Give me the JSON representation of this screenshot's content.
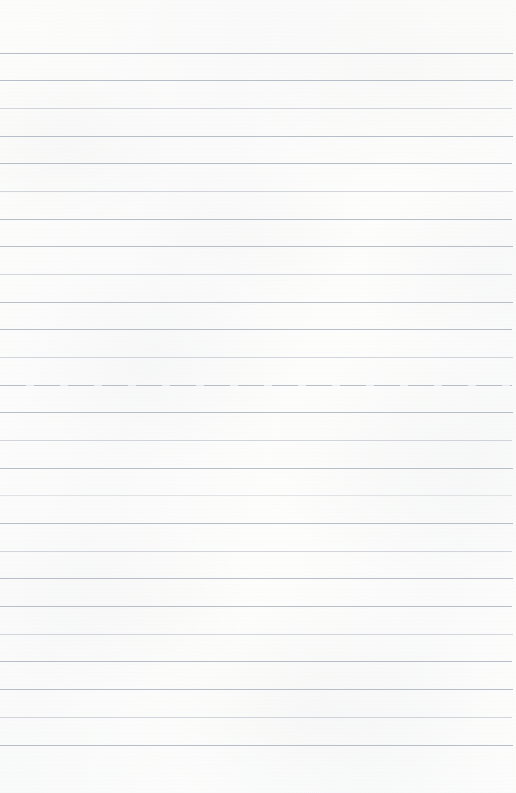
{
  "document": {
    "kind": "ruled-notebook-page",
    "title": "Blank ruled notebook page",
    "page_width": 516,
    "page_height": 793,
    "has_handwriting": false,
    "has_header": false,
    "has_margin_rule": false,
    "has_page_number": false,
    "written_text": ""
  },
  "paper": {
    "background_color": "#fdfdfc",
    "texture_color": "#969aa0",
    "edge_color": "#ffffff"
  },
  "ruling": {
    "line_color": "#b8bec8",
    "line_thickness": 1,
    "line_spacing": 27.7,
    "first_line_y": 53,
    "last_line_y": 745,
    "line_start_x": 0,
    "line_end_x": 512,
    "line_count": 26,
    "lines": [
      {
        "y": 53,
        "x": 0,
        "width": 513,
        "style": "normal"
      },
      {
        "y": 80,
        "x": 0,
        "width": 513,
        "style": "normal"
      },
      {
        "y": 108,
        "x": 0,
        "width": 512,
        "style": "faint"
      },
      {
        "y": 136,
        "x": 0,
        "width": 513,
        "style": "normal"
      },
      {
        "y": 163,
        "x": 0,
        "width": 512,
        "style": "normal"
      },
      {
        "y": 191,
        "x": 0,
        "width": 513,
        "style": "faint"
      },
      {
        "y": 219,
        "x": 0,
        "width": 512,
        "style": "normal"
      },
      {
        "y": 246,
        "x": 0,
        "width": 513,
        "style": "normal"
      },
      {
        "y": 274,
        "x": 0,
        "width": 512,
        "style": "faint"
      },
      {
        "y": 302,
        "x": 0,
        "width": 513,
        "style": "normal"
      },
      {
        "y": 329,
        "x": 0,
        "width": 512,
        "style": "normal"
      },
      {
        "y": 357,
        "x": 0,
        "width": 513,
        "style": "faint"
      },
      {
        "y": 385,
        "x": 0,
        "width": 512,
        "style": "broken"
      },
      {
        "y": 412,
        "x": 0,
        "width": 513,
        "style": "normal"
      },
      {
        "y": 440,
        "x": 0,
        "width": 512,
        "style": "faint"
      },
      {
        "y": 468,
        "x": 0,
        "width": 513,
        "style": "normal"
      },
      {
        "y": 495,
        "x": 0,
        "width": 512,
        "style": "very-faint"
      },
      {
        "y": 523,
        "x": 0,
        "width": 513,
        "style": "normal"
      },
      {
        "y": 551,
        "x": 0,
        "width": 512,
        "style": "faint"
      },
      {
        "y": 578,
        "x": 0,
        "width": 513,
        "style": "normal"
      },
      {
        "y": 606,
        "x": 0,
        "width": 512,
        "style": "normal"
      },
      {
        "y": 634,
        "x": 0,
        "width": 513,
        "style": "faint"
      },
      {
        "y": 661,
        "x": 0,
        "width": 512,
        "style": "normal"
      },
      {
        "y": 689,
        "x": 0,
        "width": 513,
        "style": "normal"
      },
      {
        "y": 717,
        "x": 0,
        "width": 512,
        "style": "faint"
      },
      {
        "y": 745,
        "x": 0,
        "width": 513,
        "style": "normal"
      }
    ]
  }
}
